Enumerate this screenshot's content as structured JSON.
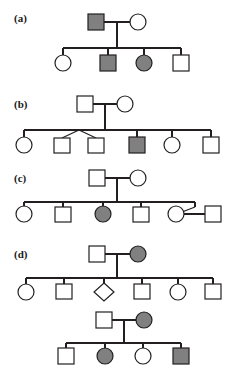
{
  "figure": {
    "width": 236,
    "height": 371,
    "background_color": "#ffffff",
    "line_color": "#231f20",
    "affected_fill_color": "#808080",
    "unaffected_fill_color": "#ffffff"
  },
  "legend_semantics": {
    "square": "male",
    "circle": "female",
    "diamond": "sex unspecified",
    "filled": "affected",
    "open": "unaffected",
    "v-connector": "fraternal twins"
  },
  "panels": [
    {
      "id": "a",
      "label": "(a)",
      "label_x": 14,
      "label_y": 22,
      "generations": [
        {
          "name": "generation-I",
          "y": 22,
          "individuals": [
            {
              "id": "a-I-1",
              "shape": "square",
              "affected": true,
              "x": 96,
              "name": "father"
            },
            {
              "id": "a-I-2",
              "shape": "circle",
              "affected": false,
              "x": 138,
              "name": "mother"
            }
          ]
        },
        {
          "name": "generation-II",
          "y": 62,
          "individuals": [
            {
              "id": "a-II-1",
              "shape": "circle",
              "affected": false,
              "x": 63,
              "name": "daughter-1"
            },
            {
              "id": "a-II-2",
              "shape": "square",
              "affected": true,
              "x": 108,
              "name": "son-1"
            },
            {
              "id": "a-II-3",
              "shape": "circle",
              "affected": true,
              "x": 144,
              "name": "daughter-2"
            },
            {
              "id": "a-II-4",
              "shape": "square",
              "affected": false,
              "x": 181,
              "name": "son-2"
            }
          ]
        }
      ],
      "mating_y": 22,
      "sibship_y": 48,
      "mating_x1": 96,
      "mating_x2": 138,
      "drop_x": 117
    },
    {
      "id": "b",
      "label": "(b)",
      "label_x": 14,
      "label_y": 104,
      "generations": [
        {
          "name": "generation-I",
          "y": 104,
          "individuals": [
            {
              "id": "b-I-1",
              "shape": "square",
              "affected": false,
              "x": 85,
              "name": "father"
            },
            {
              "id": "b-I-2",
              "shape": "circle",
              "affected": false,
              "x": 125,
              "name": "mother"
            }
          ]
        },
        {
          "name": "generation-II",
          "y": 145,
          "individuals": [
            {
              "id": "b-II-1",
              "shape": "circle",
              "affected": false,
              "x": 24,
              "name": "daughter-1"
            },
            {
              "id": "b-II-2",
              "shape": "square",
              "affected": false,
              "x": 62,
              "name": "twin-son-1"
            },
            {
              "id": "b-II-3",
              "shape": "square",
              "affected": false,
              "x": 96,
              "name": "twin-son-2"
            },
            {
              "id": "b-II-4",
              "shape": "square",
              "affected": true,
              "x": 137,
              "name": "son-affected"
            },
            {
              "id": "b-II-5",
              "shape": "circle",
              "affected": false,
              "x": 172,
              "name": "daughter-2"
            },
            {
              "id": "b-II-6",
              "shape": "square",
              "affected": false,
              "x": 211,
              "name": "son-2"
            }
          ]
        }
      ],
      "mating_y": 104,
      "sibship_y": 130,
      "mating_x1": 85,
      "mating_x2": 125,
      "drop_x": 105,
      "twins": {
        "apex_x": 79,
        "apex_y": 130,
        "left_x": 62,
        "right_x": 96
      }
    },
    {
      "id": "c",
      "label": "(c)",
      "label_x": 14,
      "label_y": 178,
      "generations": [
        {
          "name": "generation-I",
          "y": 178,
          "individuals": [
            {
              "id": "c-I-1",
              "shape": "square",
              "affected": false,
              "x": 97,
              "name": "father"
            },
            {
              "id": "c-I-2",
              "shape": "circle",
              "affected": false,
              "x": 138,
              "name": "mother"
            }
          ]
        },
        {
          "name": "generation-II",
          "y": 214,
          "individuals": [
            {
              "id": "c-II-1",
              "shape": "circle",
              "affected": false,
              "x": 24,
              "name": "daughter-1"
            },
            {
              "id": "c-II-2",
              "shape": "square",
              "affected": false,
              "x": 63,
              "name": "son-1"
            },
            {
              "id": "c-II-3",
              "shape": "circle",
              "affected": true,
              "x": 103,
              "name": "daughter-affected"
            },
            {
              "id": "c-II-4",
              "shape": "square",
              "affected": false,
              "x": 141,
              "name": "son-2"
            },
            {
              "id": "c-II-5",
              "shape": "circle",
              "affected": false,
              "x": 176,
              "name": "daughter-2"
            },
            {
              "id": "c-II-6",
              "shape": "square",
              "affected": false,
              "x": 213,
              "name": "son-in-law"
            }
          ]
        }
      ],
      "mating_y": 178,
      "sibship_y": 202,
      "mating_x1": 97,
      "mating_x2": 138,
      "drop_x": 117,
      "couple": {
        "drop_x": 195,
        "left_x": 176,
        "right_x": 213,
        "apex_y": 202,
        "mating_y": 214
      }
    },
    {
      "id": "d",
      "label": "(d)",
      "label_x": 14,
      "label_y": 254,
      "generations": [
        {
          "name": "generation-I",
          "y": 254,
          "individuals": [
            {
              "id": "d-I-1",
              "shape": "square",
              "affected": false,
              "x": 97,
              "name": "grandfather"
            },
            {
              "id": "d-I-2",
              "shape": "circle",
              "affected": true,
              "x": 138,
              "name": "grandmother-affected"
            }
          ]
        },
        {
          "name": "generation-II",
          "y": 291,
          "individuals": [
            {
              "id": "d-II-1",
              "shape": "circle",
              "affected": false,
              "x": 26,
              "name": "daughter-1"
            },
            {
              "id": "d-II-2",
              "shape": "square",
              "affected": false,
              "x": 64,
              "name": "son-1"
            },
            {
              "id": "d-II-3",
              "shape": "diamond",
              "affected": false,
              "x": 104,
              "name": "unknown-sex-child"
            },
            {
              "id": "d-II-4",
              "shape": "square",
              "affected": false,
              "x": 142,
              "name": "son-2"
            },
            {
              "id": "d-II-5",
              "shape": "circle",
              "affected": false,
              "x": 178,
              "name": "daughter-2"
            },
            {
              "id": "d-II-6",
              "shape": "square",
              "affected": false,
              "x": 213,
              "name": "son-3"
            }
          ]
        },
        {
          "name": "generation-II-couple",
          "y": 320,
          "individuals": [
            {
              "id": "d-IIb-1",
              "shape": "square",
              "affected": false,
              "x": 104,
              "name": "father-gen2"
            },
            {
              "id": "d-IIb-2",
              "shape": "circle",
              "affected": true,
              "x": 144,
              "name": "mother-gen2-affected"
            }
          ]
        },
        {
          "name": "generation-III",
          "y": 355,
          "individuals": [
            {
              "id": "d-III-1",
              "shape": "square",
              "affected": false,
              "x": 66,
              "name": "grandson-1"
            },
            {
              "id": "d-III-2",
              "shape": "circle",
              "affected": true,
              "x": 105,
              "name": "granddaughter-affected"
            },
            {
              "id": "d-III-3",
              "shape": "circle",
              "affected": false,
              "x": 143,
              "name": "granddaughter-2"
            },
            {
              "id": "d-III-4",
              "shape": "square",
              "affected": true,
              "x": 181,
              "name": "grandson-affected"
            }
          ]
        }
      ],
      "mating_y": 254,
      "sibship_y": 278,
      "mating_x1": 97,
      "mating_x2": 138,
      "drop_x": 117,
      "mating2_y": 320,
      "sibship2_y": 343,
      "mating2_x1": 104,
      "mating2_x2": 144,
      "drop2_x": 124
    }
  ]
}
